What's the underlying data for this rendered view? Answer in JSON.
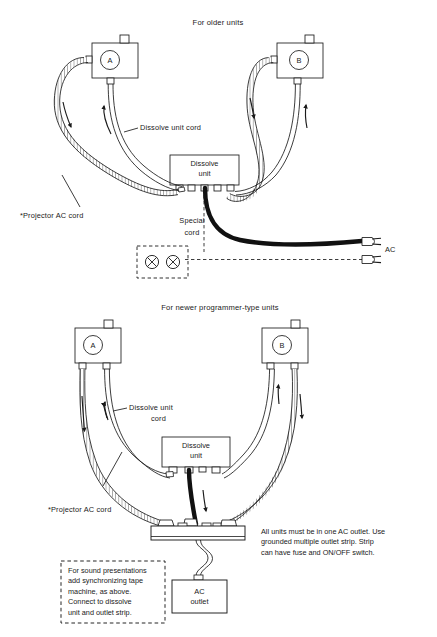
{
  "figure": {
    "title_upper": "For older units",
    "title_lower": "For newer programmer-type units"
  },
  "upper": {
    "projector_a_label": "A",
    "projector_b_label": "B",
    "dissolve_unit_line1": "Dissolve",
    "dissolve_unit_line2": "unit",
    "dissolve_cord_label": "Dissolve unit cord",
    "projector_cord_label": "*Projector AC cord",
    "special_cord_line1": "Special",
    "special_cord_line2": "cord",
    "ac_label": "AC",
    "outlet_symbol": "⊗"
  },
  "lower": {
    "projector_a_label": "A",
    "projector_b_label": "B",
    "dissolve_unit_line1": "Dissolve",
    "dissolve_unit_line2": "unit",
    "dissolve_cord_line1": "Dissolve unit",
    "dissolve_cord_line2": "cord",
    "projector_cord_label": "*Projector AC cord",
    "ac_outlet_line1": "AC",
    "ac_outlet_line2": "outlet",
    "note_right": "All units must be in one AC outlet. Use\ngrounded multiple outlet strip. Strip\ncan have fuse and ON/OFF switch.",
    "note_boxed": "For sound presentations\nadd synchronizing tape\nmachine, as above.\nConnect to dissolve\nunit and outlet strip."
  },
  "style": {
    "ink": "#1a1a1a",
    "paper": "#ffffff"
  }
}
